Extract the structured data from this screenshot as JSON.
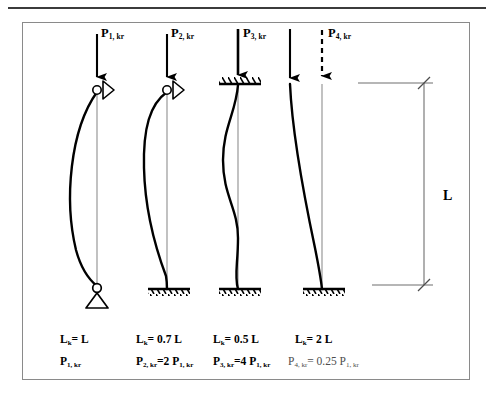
{
  "figure": {
    "border_color": "#8a8a8a",
    "rule_color": "#3b3b3b",
    "curve_color": "#000000",
    "axis_color": "#8f8f8f",
    "dim_text_color": "#4d4d4d"
  },
  "dimension": {
    "label": "L"
  },
  "columns": [
    {
      "id": "case-1",
      "load_label_main": "P",
      "load_label_sub": "1, kr",
      "arrow_style": "solid",
      "top_support": "roller-pin",
      "bottom_support": "pinned",
      "mode_shape": "half-sine",
      "effective_length_text": "L",
      "effective_length_sub": "k",
      "effective_length_value": "= L",
      "critical_load_main": "P",
      "critical_load_sub": "1, kr",
      "critical_load_value": "",
      "caption_dim": false
    },
    {
      "id": "case-2",
      "load_label_main": "P",
      "load_label_sub": "2, kr",
      "arrow_style": "solid",
      "top_support": "roller-pin",
      "bottom_support": "fixed",
      "mode_shape": "pinned-fixed",
      "effective_length_text": "L",
      "effective_length_sub": "k",
      "effective_length_value": "= 0.7 L",
      "critical_load_main": "P",
      "critical_load_sub": "2, kr",
      "critical_load_value": "=2 P",
      "critical_load_ref_sub": "1, kr",
      "caption_dim": false
    },
    {
      "id": "case-3",
      "load_label_main": "P",
      "load_label_sub": "3, kr",
      "arrow_style": "solid",
      "top_support": "fixed-slider",
      "bottom_support": "fixed",
      "mode_shape": "fixed-fixed-s",
      "effective_length_text": "L",
      "effective_length_sub": "k",
      "effective_length_value": "= 0.5 L",
      "critical_load_main": "P",
      "critical_load_sub": "3, kr",
      "critical_load_value": "=4 P",
      "critical_load_ref_sub": "1, kr",
      "caption_dim": false
    },
    {
      "id": "case-4",
      "load_label_main": "P",
      "load_label_sub": "4, kr",
      "arrow_style": "dashed",
      "top_support": "free",
      "bottom_support": "fixed",
      "mode_shape": "cantilever",
      "effective_length_text": "L",
      "effective_length_sub": "k",
      "effective_length_value": "= 2 L",
      "critical_load_main": "P",
      "critical_load_sub": "4, kr",
      "critical_load_value": "= 0.25 P",
      "critical_load_ref_sub": "1, kr",
      "caption_dim": true
    }
  ]
}
